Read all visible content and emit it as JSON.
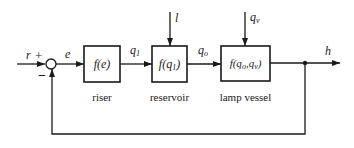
{
  "diagram": {
    "type": "block-diagram",
    "colors": {
      "stroke": "#1a1a1a",
      "background": "#ffffff"
    },
    "input": {
      "label": "r",
      "sign": "+"
    },
    "summing_junction": {
      "feedback_sign": "−"
    },
    "error_signal": {
      "label": "e"
    },
    "blocks": [
      {
        "id": "riser",
        "function": "f(e)",
        "caption": "riser"
      },
      {
        "id": "reservoir",
        "function_prefix": "f(q",
        "function_sub": "1",
        "function_suffix": ")",
        "caption": "reservoir"
      },
      {
        "id": "lamp-vessel",
        "function_prefix": "f(q",
        "function_sub1": "o",
        "function_mid": ",q",
        "function_sub2": "v",
        "function_suffix": ")",
        "caption": "lamp vessel"
      }
    ],
    "signals": {
      "q1": {
        "base": "q",
        "sub": "1"
      },
      "qo": {
        "base": "q",
        "sub": "o"
      },
      "l": {
        "label": "l"
      },
      "qv": {
        "base": "q",
        "sub": "v"
      },
      "h": {
        "label": "h"
      }
    }
  }
}
